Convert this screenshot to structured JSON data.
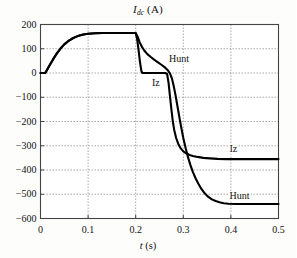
{
  "chart_data": {
    "type": "line",
    "title": "Idc (A)",
    "title_parts": {
      "symbol": "I",
      "subscript": "dc",
      "unit": "(A)"
    },
    "xlabel": "t (s)",
    "xlabel_parts": {
      "symbol": "t",
      "unit": "(s)"
    },
    "ylabel": "",
    "xlim": [
      0,
      0.5
    ],
    "ylim": [
      -600,
      200
    ],
    "xticks": [
      0,
      0.1,
      0.2,
      0.3,
      0.4,
      0.5
    ],
    "xtick_labels": [
      "0",
      "0.1",
      "0.2",
      "0.3",
      "0.4",
      "0.5"
    ],
    "yticks": [
      200,
      100,
      0,
      -100,
      -200,
      -300,
      -400,
      -500,
      -600
    ],
    "ytick_labels": [
      "200",
      "100",
      "0",
      "−100",
      "−200",
      "−300",
      "−400",
      "−500",
      "−600"
    ],
    "grid": true,
    "grid_style": "dotted",
    "legend": "none",
    "line_color": "#000000",
    "grid_color": "#8a8a8a",
    "axis_color": "#444444",
    "background": "#fdfdfc",
    "annotations": [
      {
        "text": "Hunt",
        "x": 0.268,
        "y": 55,
        "series": "Hunt"
      },
      {
        "text": "Iz",
        "x": 0.232,
        "y": -45,
        "series": "Iz"
      },
      {
        "text": "Iz",
        "x": 0.395,
        "y": -318,
        "series": "Iz"
      },
      {
        "text": "Hunt",
        "x": 0.395,
        "y": -512,
        "series": "Hunt"
      }
    ],
    "series": [
      {
        "name": "Hunt",
        "points": [
          [
            0.0,
            0
          ],
          [
            0.01,
            0
          ],
          [
            0.018,
            28
          ],
          [
            0.026,
            55
          ],
          [
            0.034,
            80
          ],
          [
            0.042,
            101
          ],
          [
            0.05,
            118
          ],
          [
            0.058,
            131
          ],
          [
            0.066,
            141
          ],
          [
            0.074,
            149
          ],
          [
            0.082,
            155
          ],
          [
            0.09,
            159
          ],
          [
            0.1,
            162
          ],
          [
            0.115,
            164
          ],
          [
            0.13,
            165
          ],
          [
            0.15,
            165
          ],
          [
            0.17,
            165
          ],
          [
            0.19,
            165
          ],
          [
            0.2,
            165
          ],
          [
            0.204,
            150
          ],
          [
            0.208,
            128
          ],
          [
            0.213,
            108
          ],
          [
            0.218,
            93
          ],
          [
            0.224,
            79
          ],
          [
            0.231,
            67
          ],
          [
            0.238,
            56
          ],
          [
            0.246,
            45
          ],
          [
            0.254,
            34
          ],
          [
            0.262,
            22
          ],
          [
            0.268,
            10
          ],
          [
            0.272,
            -2
          ],
          [
            0.276,
            -22
          ],
          [
            0.28,
            -55
          ],
          [
            0.284,
            -95
          ],
          [
            0.288,
            -140
          ],
          [
            0.292,
            -185
          ],
          [
            0.296,
            -228
          ],
          [
            0.3,
            -268
          ],
          [
            0.305,
            -310
          ],
          [
            0.31,
            -348
          ],
          [
            0.315,
            -380
          ],
          [
            0.32,
            -408
          ],
          [
            0.326,
            -435
          ],
          [
            0.332,
            -458
          ],
          [
            0.338,
            -478
          ],
          [
            0.345,
            -496
          ],
          [
            0.352,
            -510
          ],
          [
            0.36,
            -521
          ],
          [
            0.368,
            -528
          ],
          [
            0.376,
            -533
          ],
          [
            0.385,
            -537
          ],
          [
            0.395,
            -539
          ],
          [
            0.41,
            -540
          ],
          [
            0.43,
            -540
          ],
          [
            0.46,
            -540
          ],
          [
            0.5,
            -540
          ]
        ]
      },
      {
        "name": "Iz",
        "points": [
          [
            0.0,
            0
          ],
          [
            0.01,
            0
          ],
          [
            0.018,
            28
          ],
          [
            0.026,
            55
          ],
          [
            0.034,
            80
          ],
          [
            0.042,
            101
          ],
          [
            0.05,
            118
          ],
          [
            0.058,
            131
          ],
          [
            0.066,
            141
          ],
          [
            0.074,
            149
          ],
          [
            0.082,
            155
          ],
          [
            0.09,
            159
          ],
          [
            0.1,
            162
          ],
          [
            0.115,
            164
          ],
          [
            0.13,
            165
          ],
          [
            0.15,
            165
          ],
          [
            0.17,
            165
          ],
          [
            0.19,
            165
          ],
          [
            0.2,
            165
          ],
          [
            0.203,
            140
          ],
          [
            0.206,
            95
          ],
          [
            0.209,
            45
          ],
          [
            0.212,
            8
          ],
          [
            0.214,
            0
          ],
          [
            0.225,
            0
          ],
          [
            0.24,
            0
          ],
          [
            0.252,
            0
          ],
          [
            0.262,
            0
          ],
          [
            0.266,
            -4
          ],
          [
            0.269,
            -40
          ],
          [
            0.272,
            -95
          ],
          [
            0.275,
            -150
          ],
          [
            0.278,
            -200
          ],
          [
            0.281,
            -236
          ],
          [
            0.285,
            -268
          ],
          [
            0.29,
            -295
          ],
          [
            0.295,
            -312
          ],
          [
            0.3,
            -323
          ],
          [
            0.306,
            -331
          ],
          [
            0.313,
            -338
          ],
          [
            0.32,
            -342
          ],
          [
            0.33,
            -346
          ],
          [
            0.342,
            -350
          ],
          [
            0.356,
            -352
          ],
          [
            0.372,
            -354
          ],
          [
            0.39,
            -355
          ],
          [
            0.41,
            -355
          ],
          [
            0.44,
            -355
          ],
          [
            0.47,
            -355
          ],
          [
            0.5,
            -355
          ]
        ]
      }
    ]
  }
}
